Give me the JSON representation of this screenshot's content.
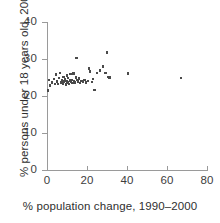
{
  "chart_data": {
    "type": "scatter",
    "title": "",
    "xlabel": "% population change, 1990–2000",
    "ylabel": "% persons under 18 years old, 2000",
    "xlim": [
      0,
      80
    ],
    "ylim": [
      0,
      40
    ],
    "xticks": [
      0,
      20,
      40,
      60,
      80
    ],
    "yticks": [
      0,
      10,
      20,
      30,
      40
    ],
    "xtick_labels": [
      "0",
      "20",
      "40",
      "60",
      "80"
    ],
    "ytick_labels": [
      "0",
      "10",
      "20",
      "30",
      "40"
    ],
    "grid": false,
    "legend": null,
    "marker": {
      "shape": "square",
      "color": "#4a4a4a",
      "size": 2.4
    },
    "axis_color": "#9a9a9a",
    "points": [
      [
        0.5,
        21.5
      ],
      [
        1.0,
        24.3
      ],
      [
        1.5,
        22.8
      ],
      [
        2.5,
        23.6
      ],
      [
        3.5,
        24.6
      ],
      [
        4.0,
        23.3
      ],
      [
        4.5,
        25.8
      ],
      [
        5.0,
        23.9
      ],
      [
        5.5,
        23.2
      ],
      [
        6.0,
        24.9
      ],
      [
        6.5,
        26.2
      ],
      [
        7.0,
        23.7
      ],
      [
        7.5,
        24.2
      ],
      [
        8.0,
        23.4
      ],
      [
        8.2,
        25.1
      ],
      [
        8.6,
        23.9
      ],
      [
        9.0,
        24.5
      ],
      [
        9.4,
        23.1
      ],
      [
        9.8,
        24.0
      ],
      [
        10.0,
        25.5
      ],
      [
        10.3,
        23.6
      ],
      [
        10.6,
        24.8
      ],
      [
        11.0,
        23.3
      ],
      [
        11.4,
        24.2
      ],
      [
        11.8,
        25.9
      ],
      [
        12.0,
        23.8
      ],
      [
        12.4,
        24.4
      ],
      [
        12.8,
        23.5
      ],
      [
        13.2,
        26.1
      ],
      [
        13.6,
        24.1
      ],
      [
        14.0,
        23.7
      ],
      [
        14.4,
        25.0
      ],
      [
        14.8,
        30.2
      ],
      [
        15.2,
        24.3
      ],
      [
        15.6,
        23.9
      ],
      [
        16.0,
        24.7
      ],
      [
        16.6,
        23.5
      ],
      [
        17.2,
        24.0
      ],
      [
        18.0,
        23.8
      ],
      [
        18.8,
        24.4
      ],
      [
        19.6,
        23.6
      ],
      [
        20.4,
        24.1
      ],
      [
        21.0,
        27.4
      ],
      [
        21.6,
        26.6
      ],
      [
        22.4,
        23.8
      ],
      [
        23.0,
        24.6
      ],
      [
        23.8,
        21.6
      ],
      [
        25.0,
        26.2
      ],
      [
        26.4,
        26.9
      ],
      [
        28.0,
        28.0
      ],
      [
        29.2,
        26.3
      ],
      [
        30.0,
        31.8
      ],
      [
        30.6,
        25.1
      ],
      [
        31.2,
        25.0
      ],
      [
        40.4,
        26.1
      ],
      [
        67.0,
        24.9
      ]
    ]
  },
  "figure": {
    "x_axis_title": "% population change, 1990–2000",
    "y_axis_title": "% persons under 18 years old, 2000"
  }
}
